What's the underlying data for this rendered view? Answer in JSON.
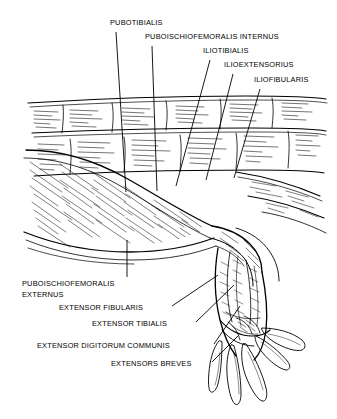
{
  "figure": {
    "kind": "anatomical-line-drawing",
    "background_color": "#ffffff",
    "ink_color": "#000000",
    "style": "pen-and-ink hatched line art"
  },
  "labels": {
    "pubotibialis": "PUBOTIBIALIS",
    "puboischiofemoralis_internus": "PUBOISCHIOFEMORALIS INTERNUS",
    "iliotibialis": "ILIOTIBIALIS",
    "ilioextensorius": "ILIOEXTENSORIUS",
    "iliofibularis": "ILIOFIBULARIS",
    "puboischiofemoralis_externus_line1": "PUBOISCHIOFEMORALIS",
    "puboischiofemoralis_externus_line2": "EXTERNUS",
    "extensor_fibularis": "EXTENSOR FIBULARIS",
    "extensor_tibialis": "EXTENSOR TIBIALIS",
    "extensor_digitorum_communis": "EXTENSOR DIGITORUM COMMUNIS",
    "extensors_breves": "EXTENSORS BREVES"
  }
}
